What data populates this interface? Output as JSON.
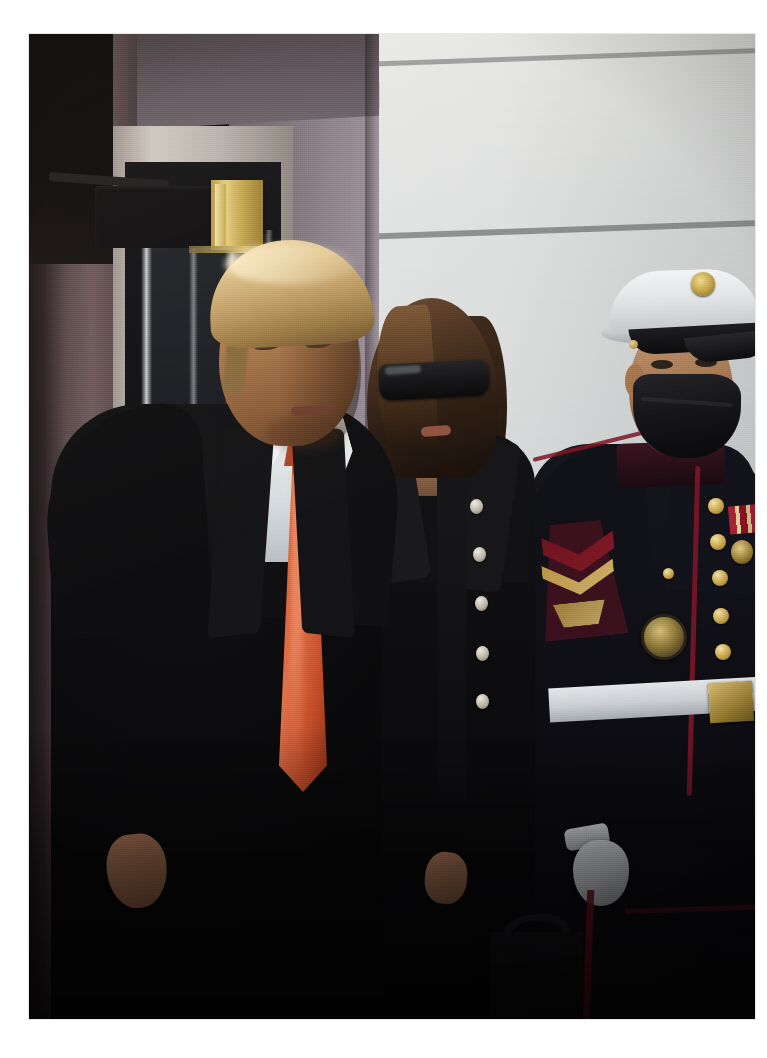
{
  "page": {
    "background_color": "#ffffff",
    "width": 767,
    "height": 1058
  },
  "photograph": {
    "frame": {
      "left": 29,
      "top": 34,
      "width": 726,
      "height": 985
    },
    "setting_description": "Exterior of a white stone portico beside a dark glass doorway with brass hardware",
    "subjects": [
      {
        "id": "man-in-suit",
        "description": "Man with swept blond-white hair in a black overcoat, white dress shirt and long orange-red tie, standing at left, head turned toward the camera's left",
        "hair_color": "#d8bd87",
        "tie_color": "#c9502f",
        "shirt_color": "#eceff1",
        "coat_color": "#0d0d0f"
      },
      {
        "id": "woman-in-sunglasses",
        "description": "Woman with long brown hair wearing large black rectangular sunglasses and a black double-breasted coat with a row of pale buttons, carrying a black handbag",
        "hair_color": "#3a2617",
        "sunglasses_color": "#131316",
        "coat_color": "#101012",
        "button_color": "#ddd6c6"
      },
      {
        "id": "marine-in-dress-blues",
        "description": "U.S. Marine at right in dress blue uniform: white peaked cap with gold eagle-globe-and-anchor emblem, black face mask, black tunic with red piping, gold buttons, corporal chevrons, ribbon rack with hanging medals, presidential service badge, white web belt with gold buckle, white glove and red trouser stripe",
        "cap_color": "#e4e7e9",
        "tunic_color": "#0d0d13",
        "piping_color": "#7e1626",
        "button_color": "#c9a54c",
        "belt_color": "#dfe3e6",
        "mask_color": "#121216"
      }
    ],
    "background_elements": [
      {
        "name": "white-limestone-wall",
        "color": "#d8dbdb"
      },
      {
        "name": "grey-corner-pier",
        "color": "#8d838c"
      },
      {
        "name": "mauve-pilaster-column",
        "color": "#5a4a4c"
      },
      {
        "name": "dark-glass-door",
        "color": "#0d0e12"
      },
      {
        "name": "brass-door-hardware",
        "color": "#c8ab55"
      },
      {
        "name": "white-door-frame",
        "color": "#cfc9c3"
      }
    ]
  }
}
